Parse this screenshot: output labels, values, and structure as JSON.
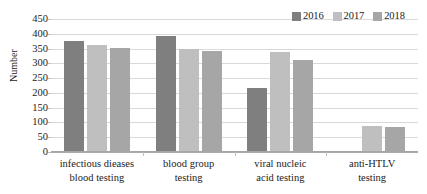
{
  "chart_data": {
    "type": "bar",
    "title": "",
    "subtitle": "",
    "xlabel": "",
    "ylabel": "Number",
    "ylim": [
      0,
      450
    ],
    "ytick_step": 50,
    "yticks": [
      0,
      50,
      100,
      150,
      200,
      250,
      300,
      350,
      400,
      450
    ],
    "ytick_labels": [
      "0",
      "50",
      "100",
      "150",
      "200",
      "250",
      "300",
      "350",
      "400",
      "450"
    ],
    "grid": true,
    "grid_axis": "y",
    "legend_position": "top-right",
    "categories": [
      "infectious dieases blood testing",
      "blood group testing",
      "viral nucleic acid testing",
      "anti-HTLV testing"
    ],
    "category_label_lines": [
      [
        "infectious dieases",
        "blood testing"
      ],
      [
        "blood group",
        "testing"
      ],
      [
        "viral nucleic",
        "acid testing"
      ],
      [
        "anti-HTLV",
        "testing"
      ]
    ],
    "series": [
      {
        "name": "2016",
        "color": "#7f7f7f",
        "values": [
          375,
          392,
          218,
          null
        ]
      },
      {
        "name": "2017",
        "color": "#bfbfbf",
        "values": [
          362,
          350,
          340,
          88
        ]
      },
      {
        "name": "2018",
        "color": "#a6a6a6",
        "values": [
          353,
          342,
          310,
          85
        ]
      }
    ],
    "annotations": []
  },
  "legend": {
    "entries": [
      {
        "label": "2016",
        "color": "#7f7f7f"
      },
      {
        "label": "2017",
        "color": "#bfbfbf"
      },
      {
        "label": "2018",
        "color": "#a6a6a6"
      }
    ]
  },
  "colors": {
    "gridline": "#d9d9d9",
    "axis": "#a6a6a6",
    "text": "#1b1b1b",
    "background": "#ffffff"
  }
}
